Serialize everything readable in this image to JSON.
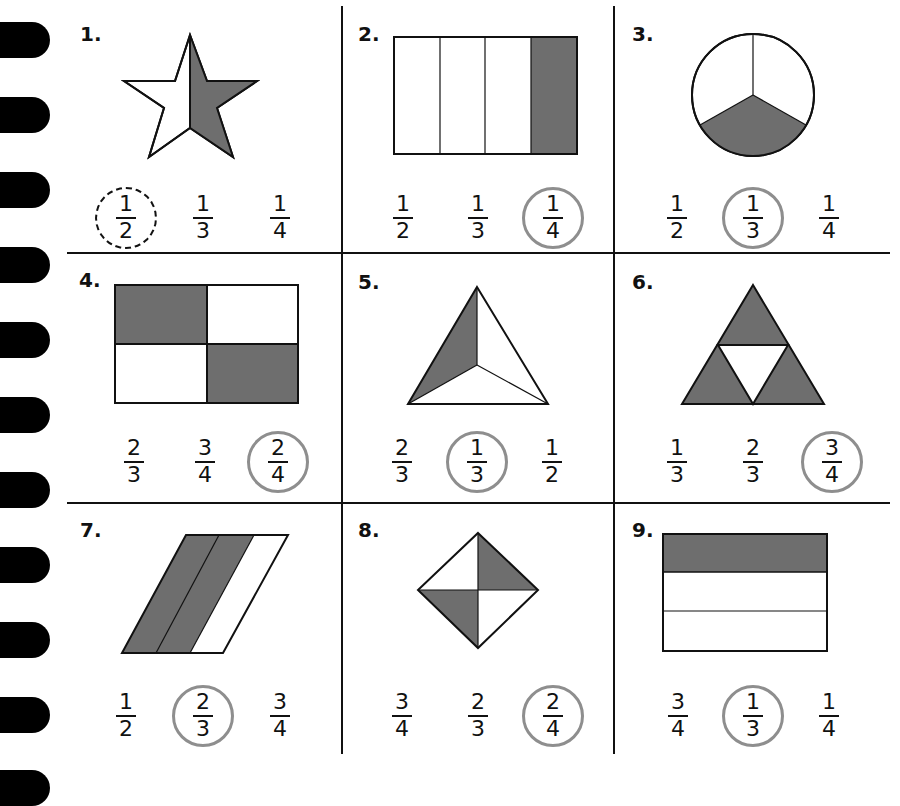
{
  "worksheet": {
    "shade_color": "#6e6e6e",
    "ring_color": "#8e8e8e",
    "problems": [
      {
        "number": "1.",
        "shape": "star",
        "shaded": "right half",
        "choices": [
          {
            "n": "1",
            "d": "2"
          },
          {
            "n": "1",
            "d": "3"
          },
          {
            "n": "1",
            "d": "4"
          }
        ],
        "selected_index": 0,
        "selected_style": "dashed"
      },
      {
        "number": "2.",
        "shape": "rectangle-4-columns",
        "shaded": "1 of 4",
        "choices": [
          {
            "n": "1",
            "d": "2"
          },
          {
            "n": "1",
            "d": "3"
          },
          {
            "n": "1",
            "d": "4"
          }
        ],
        "selected_index": 2,
        "selected_style": "solid"
      },
      {
        "number": "3.",
        "shape": "circle-3-sectors",
        "shaded": "1 of 3",
        "choices": [
          {
            "n": "1",
            "d": "2"
          },
          {
            "n": "1",
            "d": "3"
          },
          {
            "n": "1",
            "d": "4"
          }
        ],
        "selected_index": 1,
        "selected_style": "solid"
      },
      {
        "number": "4.",
        "shape": "rectangle-2x2",
        "shaded": "2 of 4",
        "choices": [
          {
            "n": "2",
            "d": "3"
          },
          {
            "n": "3",
            "d": "4"
          },
          {
            "n": "2",
            "d": "4"
          }
        ],
        "selected_index": 2,
        "selected_style": "solid"
      },
      {
        "number": "5.",
        "shape": "triangle-3-parts",
        "shaded": "1 of 3",
        "choices": [
          {
            "n": "2",
            "d": "3"
          },
          {
            "n": "1",
            "d": "3"
          },
          {
            "n": "1",
            "d": "2"
          }
        ],
        "selected_index": 1,
        "selected_style": "solid"
      },
      {
        "number": "6.",
        "shape": "triangle-4-parts",
        "shaded": "3 of 4",
        "choices": [
          {
            "n": "1",
            "d": "3"
          },
          {
            "n": "2",
            "d": "3"
          },
          {
            "n": "3",
            "d": "4"
          }
        ],
        "selected_index": 2,
        "selected_style": "solid"
      },
      {
        "number": "7.",
        "shape": "parallelogram-3-strips",
        "shaded": "2 of 3",
        "choices": [
          {
            "n": "1",
            "d": "2"
          },
          {
            "n": "2",
            "d": "3"
          },
          {
            "n": "3",
            "d": "4"
          }
        ],
        "selected_index": 1,
        "selected_style": "solid"
      },
      {
        "number": "8.",
        "shape": "diamond-4-parts",
        "shaded": "2 of 4",
        "choices": [
          {
            "n": "3",
            "d": "4"
          },
          {
            "n": "2",
            "d": "3"
          },
          {
            "n": "2",
            "d": "4"
          }
        ],
        "selected_index": 2,
        "selected_style": "solid"
      },
      {
        "number": "9.",
        "shape": "rectangle-3-rows",
        "shaded": "1 of 3",
        "choices": [
          {
            "n": "3",
            "d": "4"
          },
          {
            "n": "1",
            "d": "3"
          },
          {
            "n": "1",
            "d": "4"
          }
        ],
        "selected_index": 1,
        "selected_style": "solid"
      }
    ]
  }
}
